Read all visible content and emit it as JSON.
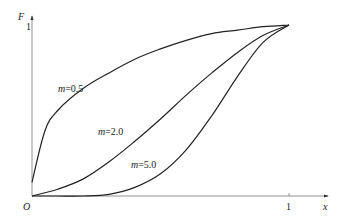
{
  "chart_data": {
    "type": "line",
    "title": "",
    "xlabel": "x",
    "ylabel": "F",
    "origin_label": "O",
    "x_tick_labels": [
      "1"
    ],
    "y_tick_labels": [
      "1"
    ],
    "xlim": [
      0,
      1.15
    ],
    "ylim": [
      0,
      1.05
    ],
    "grid": false,
    "legend": "inline labels on curves",
    "series": [
      {
        "name": "m=0.5",
        "label": "m=0.5",
        "x": [
          0,
          0.05,
          0.1,
          0.2,
          0.3,
          0.4,
          0.5,
          0.6,
          0.7,
          0.8,
          0.9,
          1.0
        ],
        "y": [
          0.08,
          0.38,
          0.5,
          0.63,
          0.72,
          0.8,
          0.86,
          0.91,
          0.95,
          0.97,
          0.99,
          1.0
        ]
      },
      {
        "name": "m=2.0",
        "label": "m=2.0",
        "x": [
          0,
          0.1,
          0.2,
          0.3,
          0.4,
          0.5,
          0.6,
          0.7,
          0.8,
          0.9,
          1.0
        ],
        "y": [
          0.0,
          0.04,
          0.1,
          0.2,
          0.32,
          0.45,
          0.59,
          0.72,
          0.84,
          0.94,
          1.0
        ]
      },
      {
        "name": "m=5.0",
        "label": "m=5.0",
        "x": [
          0,
          0.1,
          0.2,
          0.3,
          0.4,
          0.5,
          0.6,
          0.7,
          0.8,
          0.9,
          1.0
        ],
        "y": [
          0.0,
          0.0,
          0.0,
          0.01,
          0.05,
          0.13,
          0.27,
          0.47,
          0.7,
          0.9,
          1.0
        ]
      }
    ]
  },
  "labels": {
    "y_axis": "F",
    "x_axis": "x",
    "origin": "O",
    "x_one": "1",
    "y_one": "1",
    "m_prefix": "m",
    "m05": "=0.5",
    "m20": "=2.0",
    "m50": "=5.0"
  }
}
